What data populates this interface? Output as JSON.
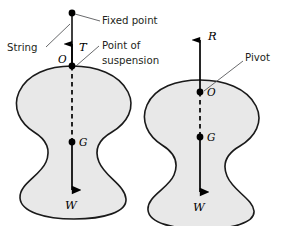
{
  "figure": {
    "background_color": "#ffffff",
    "body_fill_color": "#e8e8e8",
    "body_outline_color": "#1a1a1a",
    "leader_color": "#58595b",
    "text_color": "#231f20"
  },
  "left_diagram": {
    "name": "suspended-body",
    "labels": {
      "fixed_point": "Fixed point",
      "string": "String",
      "point_of_suspension_line1": "Point of",
      "point_of_suspension_line2": "suspension"
    },
    "vectors": {
      "tension": "T",
      "weight": "W"
    },
    "points": {
      "suspension": "O",
      "centre_of_gravity": "G"
    }
  },
  "right_diagram": {
    "name": "pivoted-body",
    "labels": {
      "pivot": "Pivot"
    },
    "vectors": {
      "reaction": "R",
      "weight": "W"
    },
    "points": {
      "pivot": "O",
      "centre_of_gravity": "G"
    }
  }
}
